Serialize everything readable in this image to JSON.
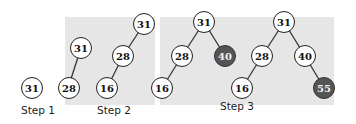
{
  "steps": [
    {
      "label": "Step 1"
    },
    {
      "label": "Step 2"
    },
    {
      "label": "Step 3"
    }
  ],
  "nodes": {
    "s1_root": "31",
    "s2a_root": "31",
    "s2a_left": "28",
    "s2b_root": "31",
    "s2b_mid": "28",
    "s2b_leaf": "16",
    "s3a_root": "31",
    "s3a_left": "28",
    "s3a_right": "40",
    "s3a_leaf": "16",
    "s3b_root": "31",
    "s3b_left": "28",
    "s3b_right": "40",
    "s3b_leftleaf": "16",
    "s3b_rightleaf": "55"
  },
  "colors": {
    "panel": "#e6e6e6",
    "highlight_node": "#555555",
    "node": "#ffffff"
  }
}
